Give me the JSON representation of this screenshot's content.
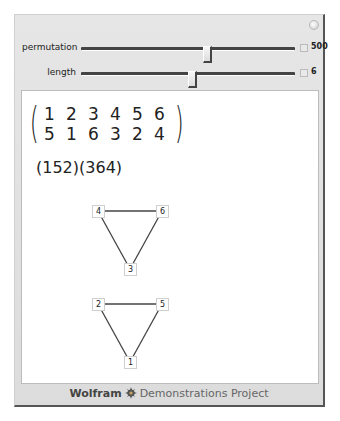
{
  "controls": {
    "permutation": {
      "label": "permutation",
      "value": "500",
      "thumb_fraction": 0.59
    },
    "length": {
      "label": "length",
      "value": "6",
      "thumb_fraction": 0.52
    }
  },
  "icons": {
    "plus": "plus-circle-icon",
    "animate": "animation-toggle-icon",
    "gear": "wolfram-spikey-icon"
  },
  "output": {
    "matrix": {
      "top": [
        "1",
        "2",
        "3",
        "4",
        "5",
        "6"
      ],
      "bottom": [
        "5",
        "1",
        "6",
        "3",
        "2",
        "4"
      ]
    },
    "cycle_notation": "(152)(364)",
    "graphs": [
      {
        "nodes": [
          {
            "label": "4",
            "x": 76,
            "y": 120
          },
          {
            "label": "6",
            "x": 140,
            "y": 120
          },
          {
            "label": "3",
            "x": 108,
            "y": 178
          }
        ],
        "edges": [
          [
            "4",
            "6"
          ],
          [
            "4",
            "3"
          ],
          [
            "6",
            "3"
          ]
        ]
      },
      {
        "nodes": [
          {
            "label": "2",
            "x": 76,
            "y": 213
          },
          {
            "label": "5",
            "x": 140,
            "y": 213
          },
          {
            "label": "1",
            "x": 108,
            "y": 271
          }
        ],
        "edges": [
          [
            "2",
            "5"
          ],
          [
            "2",
            "1"
          ],
          [
            "5",
            "1"
          ]
        ]
      }
    ]
  },
  "footer": {
    "brand": "Wolfram",
    "project": "Demonstrations Project"
  },
  "colors": {
    "panel_bg": "#e0e0e0",
    "content_bg": "#ffffff",
    "edge": "#444444",
    "text": "#222222"
  }
}
